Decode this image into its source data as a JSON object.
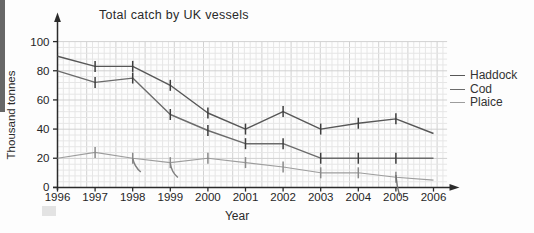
{
  "chart_data": {
    "type": "line",
    "title": "Total catch by UK vessels",
    "xlabel": "Year",
    "ylabel": "Thousand tonnes",
    "x": [
      1996,
      1997,
      1998,
      1999,
      2000,
      2001,
      2002,
      2003,
      2004,
      2005,
      2006
    ],
    "yticks": [
      0,
      20,
      40,
      60,
      80,
      100
    ],
    "ylim": [
      0,
      100
    ],
    "grid": "fine graph-paper grid, light gray",
    "legend_position": "right",
    "error_bars_on_interior_points": true,
    "series": [
      {
        "name": "Haddock",
        "color": "#575757",
        "values": [
          90,
          83,
          83,
          70,
          51,
          40,
          52,
          40,
          44,
          47,
          37
        ]
      },
      {
        "name": "Cod",
        "color": "#6b6b6b",
        "values": [
          80,
          72,
          75,
          50,
          39,
          30,
          30,
          20,
          20,
          20,
          20
        ]
      },
      {
        "name": "Plaice",
        "color": "#9d9d9d",
        "values": [
          20,
          24,
          20,
          17,
          20,
          17,
          14,
          10,
          10,
          7,
          5
        ]
      }
    ]
  }
}
